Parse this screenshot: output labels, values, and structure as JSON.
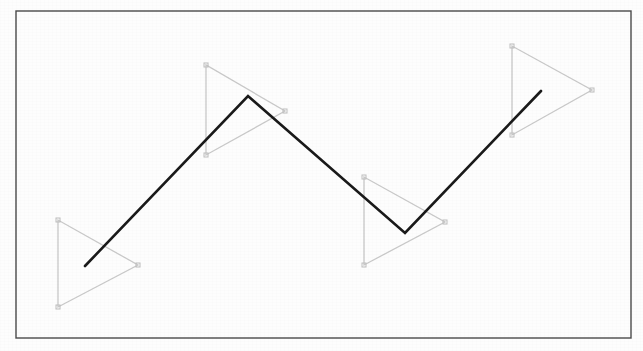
{
  "figure": {
    "background_color": "#fdfdfd",
    "width": 643,
    "height": 351,
    "border": {
      "name": "figure-border",
      "color": "#4a4a4a",
      "stroke_width": 1.4,
      "x": 16,
      "y": 11,
      "width": 615,
      "height": 327
    }
  },
  "chart_data": {
    "type": "scatter",
    "xlabel": "",
    "ylabel": "",
    "xlim": [
      16,
      631
    ],
    "ylim": [
      11,
      338
    ],
    "grid": false,
    "legend": "none",
    "annotations": [
      "Four light-gray leftward-pointing triangles placed along a rising-falling path",
      "One dark polyline zigzag passing through the triangles"
    ],
    "series": [
      {
        "name": "triangles",
        "type": "polygon-markers",
        "color": "#c9c9c9",
        "stroke_width": 1.3,
        "marker": "square",
        "marker_size": 4,
        "marker_color": "#bdbdbd",
        "items": [
          {
            "label": "triangle-1",
            "points": [
              [
                58,
                220
              ],
              [
                58,
                307
              ],
              [
                138,
                265
              ]
            ]
          },
          {
            "label": "triangle-2",
            "points": [
              [
                206,
                65
              ],
              [
                206,
                155
              ],
              [
                285,
                111
              ]
            ]
          },
          {
            "label": "triangle-3",
            "points": [
              [
                364,
                177
              ],
              [
                364,
                265
              ],
              [
                445,
                222
              ]
            ]
          },
          {
            "label": "triangle-4",
            "points": [
              [
                512,
                46
              ],
              [
                512,
                135
              ],
              [
                592,
                90
              ]
            ]
          }
        ]
      },
      {
        "name": "polyline",
        "type": "line",
        "color": "#1a1a1a",
        "stroke_width": 2.6,
        "x": [
          85,
          248,
          405,
          541
        ],
        "y": [
          266,
          96,
          233,
          91
        ],
        "points": [
          [
            85,
            266
          ],
          [
            248,
            96
          ],
          [
            405,
            233
          ],
          [
            541,
            91
          ]
        ]
      }
    ]
  }
}
